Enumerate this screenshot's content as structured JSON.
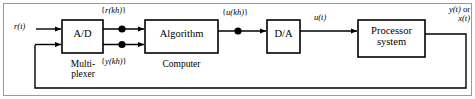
{
  "figure": {
    "type": "block-diagram",
    "border_color": "#9a9a9a",
    "line_color": "#000000",
    "background": "#ffffff"
  },
  "blocks": [
    {
      "id": "ad",
      "label": "A/D",
      "label_line1": "A/D",
      "label_line2": ""
    },
    {
      "id": "algorithm",
      "label": "Algorithm",
      "label_line1": "Algorithm",
      "label_line2": ""
    },
    {
      "id": "da",
      "label": "D/A",
      "label_line1": "D/A",
      "label_line2": ""
    },
    {
      "id": "processor",
      "label": "Processor system",
      "label_line1": "Processor",
      "label_line2": "system"
    }
  ],
  "group_labels": [
    {
      "id": "multiplexer",
      "line1": "Multi-",
      "line2": "plexer"
    },
    {
      "id": "computer",
      "line1": "Computer",
      "line2": ""
    }
  ],
  "signals": {
    "input": {
      "text": "r(t)",
      "var": "r",
      "arg": "(t)"
    },
    "sampled_ref": {
      "text": "{r(kh)}",
      "open": "{",
      "var": "r",
      "arg": "(kh)",
      "close": "}"
    },
    "sampled_output": {
      "text": "{y(kh)}",
      "open": "{",
      "var": "y",
      "arg": "(kh)",
      "close": "}"
    },
    "control_digital": {
      "text": "{u(kh)}",
      "open": "{",
      "var": "u",
      "arg": "(kh)",
      "close": "}"
    },
    "control_analog": {
      "text": "u(t)",
      "var": "u",
      "arg": "(t)"
    },
    "output": {
      "text": "y(t) or x(t)",
      "line1_var": "y",
      "line1_arg": "(t)",
      "line1_suffix": " or",
      "line2_var": "x",
      "line2_arg": "(t)"
    }
  },
  "nodes": [
    {
      "id": "node-r-kh",
      "signal": "{r(kh)}"
    },
    {
      "id": "node-y-kh",
      "signal": "{y(kh)}"
    },
    {
      "id": "node-u-kh",
      "signal": "{u(kh)}"
    }
  ]
}
